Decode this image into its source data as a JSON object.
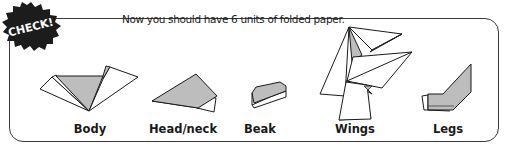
{
  "badge": {
    "text": "CHECK!",
    "icon": "starburst-badge-icon",
    "color": "#1c1c1c"
  },
  "instruction": "Now you should have 6 units of folded paper.",
  "colors": {
    "fold_fill": "#bdbdbd",
    "paper": "#ffffff",
    "outline": "#1a1a1a"
  },
  "units": [
    {
      "label": "Body",
      "icon": "body-fold-icon"
    },
    {
      "label": "Head/neck",
      "icon": "head-neck-fold-icon"
    },
    {
      "label": "Beak",
      "icon": "beak-fold-icon"
    },
    {
      "label": "Wings",
      "icon": "wings-fold-icon"
    },
    {
      "label": "Legs",
      "icon": "legs-fold-icon"
    }
  ]
}
